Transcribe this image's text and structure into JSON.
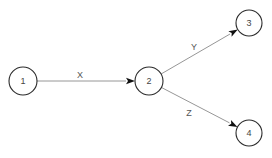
{
  "diagram": {
    "type": "directed-graph",
    "colors": {
      "background": "#ffffff",
      "node_stroke": "#2a2a2a",
      "node_fill": "#ffffff",
      "edge_stroke": "#8a8a8a",
      "arrowhead": "#111111",
      "text": "#444444"
    },
    "nodes": [
      {
        "id": "1",
        "label": "1",
        "cx": 23,
        "cy": 81,
        "r": 14
      },
      {
        "id": "2",
        "label": "2",
        "cx": 149,
        "cy": 81,
        "r": 14
      },
      {
        "id": "3",
        "label": "3",
        "cx": 249,
        "cy": 23,
        "r": 13
      },
      {
        "id": "4",
        "label": "4",
        "cx": 249,
        "cy": 133,
        "r": 13
      }
    ],
    "edges": [
      {
        "from": "1",
        "to": "2",
        "label": "X",
        "label_x": 80,
        "label_y": 75
      },
      {
        "from": "2",
        "to": "3",
        "label": "Y",
        "label_x": 194,
        "label_y": 47
      },
      {
        "from": "2",
        "to": "4",
        "label": "Z",
        "label_x": 189,
        "label_y": 113
      }
    ]
  }
}
